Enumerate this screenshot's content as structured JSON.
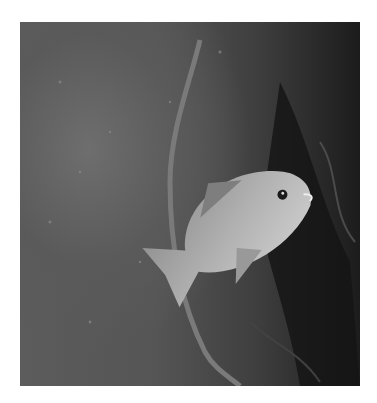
{
  "image": {
    "description": "Grayscale underwater photograph of a fish swimming head-down near a thin kelp stalk, with dark seaweed on the right",
    "subjects": [
      "fish",
      "kelp-stalk",
      "seaweed",
      "rocky-seafloor"
    ],
    "colors": {
      "background": "#ffffff",
      "water_light": "#6e6e6e",
      "water_dark": "#1c1c1c",
      "fish_body": "#a8a8a8",
      "fish_belly": "#cfcfcf"
    }
  }
}
